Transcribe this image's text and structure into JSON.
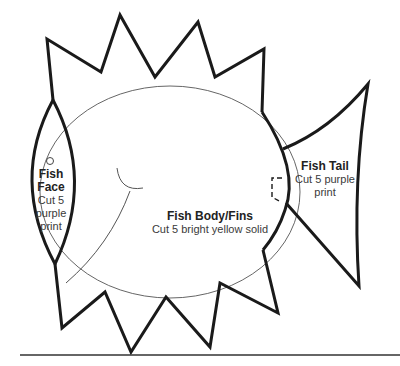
{
  "pattern": {
    "type": "fish applique template",
    "pieces": [
      {
        "id": "face",
        "title": "Fish Face",
        "instructions_lines": [
          "Cut 5",
          "purple",
          "print"
        ]
      },
      {
        "id": "body",
        "title": "Fish Body/Fins",
        "instructions_lines": [
          "Cut 5 bright yellow solid"
        ]
      },
      {
        "id": "tail",
        "title": "Fish Tail",
        "instructions_lines": [
          "Cut 5 purple",
          "print"
        ]
      }
    ],
    "features": [
      "eye-circle",
      "mouth-curve",
      "dashed-tail-overlap-marker",
      "bottom-rule-line"
    ],
    "colors": {
      "line": "#1a1a1a",
      "thin_line": "#555555",
      "background": "#ffffff"
    }
  }
}
